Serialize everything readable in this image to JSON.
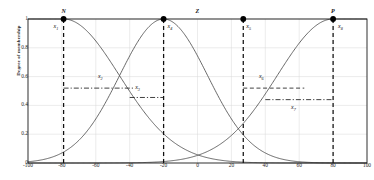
{
  "chart_data": {
    "type": "line",
    "title": "",
    "xlabel": "",
    "ylabel": "Degree of membership",
    "xlim": [
      -100,
      100
    ],
    "ylim": [
      0,
      1
    ],
    "grid": true,
    "legend_position": "in-plot-top",
    "xticks": [
      -100,
      -80,
      -60,
      -40,
      -20,
      0,
      20,
      40,
      60,
      80,
      100
    ],
    "xtick_labels": [
      "-100",
      "-80",
      "-60",
      "-40",
      "-20",
      "0",
      "20",
      "40",
      "60",
      "80",
      "100"
    ],
    "yticks": [
      0,
      0.2,
      0.4,
      0.6,
      0.8,
      1
    ],
    "ytick_labels": [
      "0",
      "0.2",
      "0.4",
      "0.6",
      "0.8",
      "1"
    ],
    "series": [
      {
        "name": "N",
        "label": "N",
        "shape": "gaussian-left-shoulder",
        "center": -79,
        "sigma": 33,
        "label_x": -79,
        "label_y": 1.0
      },
      {
        "name": "Z",
        "label": "Z",
        "shape": "gaussian",
        "center": -20,
        "sigma": 26,
        "label_x": 0,
        "label_y": 1.0
      },
      {
        "name": "P",
        "label": "P",
        "shape": "gaussian-right-shoulder",
        "center": 80,
        "sigma": 33,
        "label_x": 80,
        "label_y": 1.0
      }
    ],
    "markers": [
      {
        "label": "x1",
        "label_html": "x<sub>1</sub>",
        "x": -79,
        "y": 1.0
      },
      {
        "label": "x4",
        "label_html": "x<sub>4</sub>",
        "x": -20,
        "y": 1.0
      },
      {
        "label": "x5",
        "label_html": "x<sub>5</sub>",
        "x": 27,
        "y": 1.0
      },
      {
        "label": "x8",
        "label_html": "x<sub>8</sub>",
        "x": 80,
        "y": 1.0
      }
    ],
    "reference_lines": [
      {
        "label": "x2",
        "label_html": "x<sub>2</sub>",
        "style": "dashdot",
        "y": 0.52,
        "x_start": -79,
        "x_end": -37,
        "label_x": -57,
        "label_y": 0.6
      },
      {
        "label": "x3",
        "label_html": "x<sub>3</sub>",
        "style": "dashdot",
        "y": 0.455,
        "x_start": -40,
        "x_end": -20,
        "label_x": -35,
        "label_y": 0.52
      },
      {
        "label": "x6",
        "label_html": "x<sub>6</sub>",
        "style": "dashed",
        "y": 0.52,
        "x_start": 27,
        "x_end": 63,
        "label_x": 38,
        "label_y": 0.6
      },
      {
        "label": "x7",
        "label_html": "x<sub>7</sub>",
        "style": "dashdot",
        "y": 0.44,
        "x_start": 40,
        "x_end": 80,
        "label_x": 57,
        "label_y": 0.38
      }
    ],
    "vertical_markers": [
      {
        "x": -79,
        "style": "dashed",
        "from": 0,
        "to": 1
      },
      {
        "x": -20,
        "style": "dashed",
        "from": 0,
        "to": 1
      },
      {
        "x": 27,
        "style": "dashed",
        "from": 0,
        "to": 1
      },
      {
        "x": 80,
        "style": "dashed",
        "from": 0,
        "to": 1
      }
    ],
    "colors": {
      "curve": "#4d4d4d",
      "axis": "#1a1a1a",
      "grid": "#d9d9d9",
      "marker": "#000000",
      "text": "#1a1a1a"
    }
  },
  "axis": {
    "ylabel": "Degree of membership"
  },
  "labels": {
    "n": "N",
    "z": "Z",
    "p": "P"
  }
}
